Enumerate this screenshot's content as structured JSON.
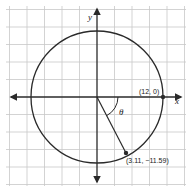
{
  "diagram": {
    "type": "coordinate-plane-circle",
    "axes": {
      "x_label": "x",
      "y_label": "y"
    },
    "circle": {
      "center": [
        0,
        0
      ],
      "radius": 12
    },
    "points": [
      {
        "label": "(12, 0)",
        "x": 12,
        "y": 0
      },
      {
        "label": "(3.11, −11.59)",
        "x": 3.11,
        "y": -11.59
      }
    ],
    "angle_label": "θ",
    "colors": {
      "grid": "#c8c8c8",
      "stroke": "#2a2a2a",
      "background": "#ffffff"
    }
  }
}
